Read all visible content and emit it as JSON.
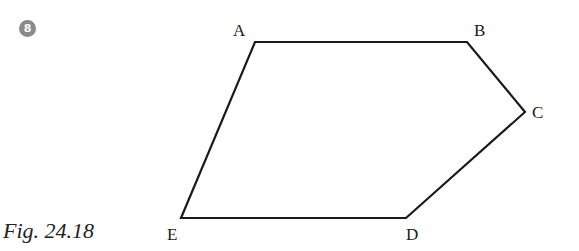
{
  "problem": {
    "number": "8",
    "badge_color": "#8a8a8a"
  },
  "figure": {
    "caption": "Fig. 24.18",
    "shape": "pentagon",
    "stroke_color": "#1a1a1a",
    "vertices": [
      {
        "label": "A",
        "x": 255,
        "y": 42
      },
      {
        "label": "B",
        "x": 467,
        "y": 42
      },
      {
        "label": "C",
        "x": 525,
        "y": 112
      },
      {
        "label": "D",
        "x": 406,
        "y": 218
      },
      {
        "label": "E",
        "x": 181,
        "y": 218
      }
    ]
  }
}
